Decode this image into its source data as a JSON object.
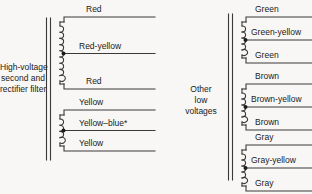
{
  "diagram": {
    "background_color": "#f8f7f5",
    "line_color": "#3a3a3a",
    "sections": [
      {
        "name": "high-voltage-section",
        "block_label": {
          "line1": "High-voltage",
          "line2": "second and",
          "line3": "rectifier filter"
        },
        "windings": [
          {
            "name": "high-voltage-winding",
            "turns": 9,
            "center_tapped": true,
            "leads": [
              {
                "position": "top",
                "label": "Red"
              },
              {
                "position": "center-tap",
                "label": "Red-yellow"
              },
              {
                "position": "bottom",
                "label": "Red"
              }
            ]
          },
          {
            "name": "rectifier-filament-winding",
            "turns": 4,
            "center_tapped": true,
            "leads": [
              {
                "position": "top",
                "label": "Yellow"
              },
              {
                "position": "center-tap",
                "label": "Yellow–blue*"
              },
              {
                "position": "bottom",
                "label": "Yellow"
              }
            ]
          }
        ]
      },
      {
        "name": "low-voltage-section",
        "block_label": {
          "line1": "Other",
          "line2": "low",
          "line3": "voltages"
        },
        "windings": [
          {
            "name": "green-winding",
            "turns": 5,
            "center_tapped": true,
            "leads": [
              {
                "position": "top",
                "label": "Green"
              },
              {
                "position": "center-tap",
                "label": "Green-yellow"
              },
              {
                "position": "bottom",
                "label": "Green"
              }
            ]
          },
          {
            "name": "brown-winding",
            "turns": 5,
            "center_tapped": true,
            "leads": [
              {
                "position": "top",
                "label": "Brown"
              },
              {
                "position": "center-tap",
                "label": "Brown-yellow"
              },
              {
                "position": "bottom",
                "label": "Brown"
              }
            ]
          },
          {
            "name": "gray-winding",
            "turns": 5,
            "center_tapped": true,
            "leads": [
              {
                "position": "top",
                "label": "Gray"
              },
              {
                "position": "center-tap",
                "label": "Gray-yellow"
              },
              {
                "position": "bottom",
                "label": "Gray"
              }
            ]
          }
        ]
      }
    ]
  }
}
